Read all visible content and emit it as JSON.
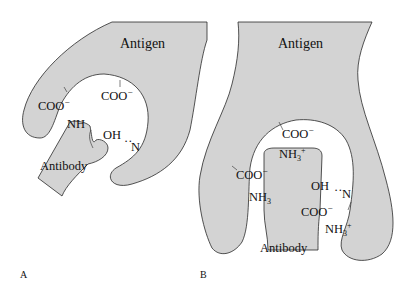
{
  "figure": {
    "fill_color": "#d3d3d3",
    "outline_color": "#2a2a2a",
    "panels": [
      {
        "id": "A",
        "panel_label": "A",
        "antigen_label": "Antigen",
        "antibody_label": "Antibody",
        "groups": {
          "coo_left": "COO",
          "coo_left_charge": "−",
          "coo_top": "COO",
          "coo_top_charge": "−",
          "nh": "NH",
          "oh": "OH",
          "hbond": "··",
          "n": "N"
        }
      },
      {
        "id": "B",
        "panel_label": "B",
        "antigen_label": "Antigen",
        "antibody_label": "Antibody",
        "groups": {
          "coo_top": "COO",
          "coo_top_charge": "−",
          "nh3_top": "NH",
          "nh3_top_sub": "3",
          "nh3_top_charge": "+",
          "coo_left": "COO",
          "coo_left_charge": "−",
          "nh3_left": "NH",
          "nh3_left_sub": "3",
          "oh": "OH",
          "hbond": "··",
          "n": "N",
          "coo_right": "COO",
          "coo_right_charge": "−",
          "nh3_right": "NH",
          "nh3_right_sub": "3",
          "nh3_right_charge": "+"
        }
      }
    ]
  }
}
